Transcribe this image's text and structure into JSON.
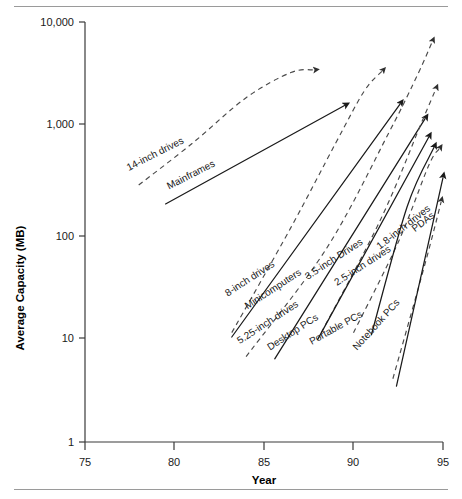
{
  "chart_data": {
    "type": "line",
    "title": "",
    "subtitle": "",
    "xlabel": "Year",
    "ylabel": "Average Capacity (MB)",
    "xlim": [
      75,
      95
    ],
    "ylim": [
      1,
      10000
    ],
    "yscale": "log",
    "xscale": "linear",
    "grid": false,
    "legend": "inline-labels",
    "xticks": [
      "75",
      "80",
      "85",
      "90",
      "95"
    ],
    "xtick_values": [
      75,
      80,
      85,
      90,
      95
    ],
    "yticks": [
      "1",
      "10",
      "100",
      "1,000",
      "10,000"
    ],
    "ytick_values": [
      1,
      10,
      100,
      1000,
      10000
    ],
    "series": [
      {
        "name": "14-inch drives",
        "style": "dashed",
        "arrow": true,
        "x": [
          78.0,
          81.0,
          84.0,
          86.5,
          87.8
        ],
        "y": [
          280,
          700,
          1900,
          3300,
          3500
        ]
      },
      {
        "name": "Mainframes",
        "style": "solid",
        "arrow": true,
        "x": [
          79.5,
          89.5
        ],
        "y": [
          185,
          1600
        ]
      },
      {
        "name": "8-inch drives",
        "style": "dashed",
        "arrow": true,
        "x": [
          83.2,
          86.5,
          89.0,
          90.6,
          91.6
        ],
        "y": [
          11,
          110,
          700,
          2200,
          3400
        ]
      },
      {
        "name": "Minicomputers",
        "style": "solid",
        "arrow": true,
        "x": [
          83.2,
          92.6
        ],
        "y": [
          10,
          1650
        ]
      },
      {
        "name": "5.25-inch drives",
        "style": "dashed",
        "arrow": true,
        "x": [
          84.0,
          88.5,
          92.0,
          93.6,
          94.4
        ],
        "y": [
          6.5,
          70,
          900,
          3200,
          6500
        ]
      },
      {
        "name": "Desktop PCs",
        "style": "solid",
        "arrow": true,
        "x": [
          85.6,
          94.0
        ],
        "y": [
          6.2,
          1200
        ]
      },
      {
        "name": "3.5-inch Drives",
        "style": "dashed",
        "arrow": true,
        "x": [
          88.2,
          91.5,
          93.8,
          94.6
        ],
        "y": [
          11,
          130,
          1100,
          2300
        ]
      },
      {
        "name": "2.5-inch drives",
        "style": "dashed",
        "arrow": true,
        "x": [
          90.0,
          92.5,
          94.2,
          94.8
        ],
        "y": [
          11,
          80,
          430,
          620
        ]
      },
      {
        "name": "Portable PCs",
        "style": "solid",
        "arrow": true,
        "x": [
          88.0,
          94.2
        ],
        "y": [
          9.5,
          800
        ]
      },
      {
        "name": "Notebook PCs",
        "style": "solid",
        "arrow": true,
        "x": [
          91.0,
          93.0,
          94.5
        ],
        "y": [
          10.5,
          175,
          640
        ]
      },
      {
        "name": "1.8-inch drives",
        "style": "dashed",
        "arrow": true,
        "x": [
          92.2,
          94.0,
          94.9
        ],
        "y": [
          4.0,
          50,
          195
        ]
      },
      {
        "name": "PDAs",
        "style": "solid",
        "arrow": true,
        "x": [
          92.4,
          95.0
        ],
        "y": [
          3.4,
          330
        ]
      }
    ],
    "annotations": [
      {
        "text": "14-inch drives",
        "x": 79.0,
        "y": 520,
        "rotation": -27
      },
      {
        "text": "Mainframes",
        "x": 81.0,
        "y": 330,
        "rotation": -27
      },
      {
        "text": "8-inch drives",
        "x": 84.3,
        "y": 34,
        "rotation": -33
      },
      {
        "text": "Minicomputers",
        "x": 85.6,
        "y": 27,
        "rotation": -33
      },
      {
        "text": "5.25-inch drives",
        "x": 85.3,
        "y": 13,
        "rotation": -33
      },
      {
        "text": "Desktop PCs",
        "x": 86.7,
        "y": 10.5,
        "rotation": -33
      },
      {
        "text": "3.5-inch Drives",
        "x": 89.0,
        "y": 52,
        "rotation": -33
      },
      {
        "text": "2.5-inch drives",
        "x": 90.6,
        "y": 45,
        "rotation": -33
      },
      {
        "text": "Portable PCs",
        "x": 89.1,
        "y": 11.5,
        "rotation": -29
      },
      {
        "text": "Notebook PCs",
        "x": 91.4,
        "y": 12.5,
        "rotation": -48
      },
      {
        "text": "1.8-inch drives",
        "x": 92.9,
        "y": 105,
        "rotation": -38
      },
      {
        "text": "PDAs",
        "x": 94.0,
        "y": 118,
        "rotation": -38
      }
    ]
  },
  "axes": {
    "xlabel": "Year",
    "ylabel": "Average Capacity (MB)"
  }
}
